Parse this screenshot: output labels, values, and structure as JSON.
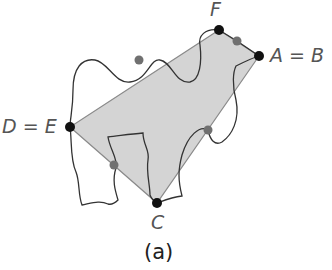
{
  "figure": {
    "caption": "(a)",
    "colors": {
      "polygon_fill": "#d4d4d4",
      "polygon_edge": "#8a8a8a",
      "curve": "#333333",
      "vertex": "#111111",
      "intersection": "#707070"
    },
    "labels": {
      "F": "F",
      "AB": "A = B",
      "DE": "D = E",
      "C": "C"
    },
    "vertices": [
      {
        "name": "F",
        "x": 219,
        "y": 30
      },
      {
        "name": "A=B",
        "x": 259,
        "y": 56
      },
      {
        "name": "C",
        "x": 157,
        "y": 203
      },
      {
        "name": "D=E",
        "x": 70,
        "y": 127
      }
    ],
    "intersection_points": [
      {
        "x": 139,
        "y": 60
      },
      {
        "x": 237,
        "y": 41
      },
      {
        "x": 208,
        "y": 130
      },
      {
        "x": 114,
        "y": 165
      }
    ]
  }
}
